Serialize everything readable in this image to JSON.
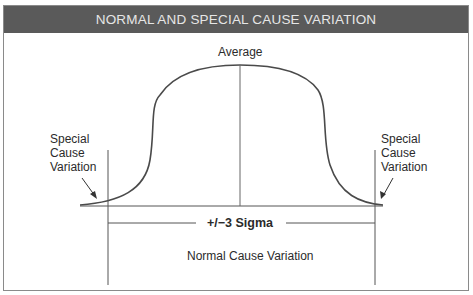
{
  "header": {
    "title": "NORMAL AND SPECIAL CAUSE VARIATION"
  },
  "labels": {
    "average": "Average",
    "special_left": [
      "Special",
      "Cause",
      "Variation"
    ],
    "special_right": [
      "Special",
      "Cause",
      "Variation"
    ],
    "sigma": "+/−3 Sigma",
    "normal": "Normal Cause Variation"
  },
  "colors": {
    "header_bg": "#5a5a5a",
    "header_text": "#e6e6e6",
    "line": "#555555",
    "curve": "#4a4a4a"
  }
}
